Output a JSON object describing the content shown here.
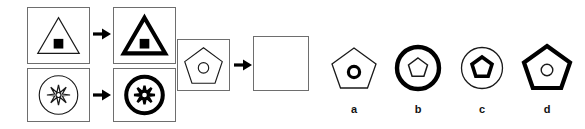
{
  "puzzle": {
    "kind": "visual-analogy-matrix",
    "rule_description": "outer shape outline becomes bold/thick; inner shape unchanged",
    "stroke_colors": {
      "thin": "#1a1a1a",
      "bold": "#000000",
      "panel_border": "#6e6e6e",
      "fill_black": "#000000",
      "background": "#ffffff"
    },
    "stroke_widths": {
      "thin": 1.2,
      "bold": 4.2,
      "inner_thin": 1.2,
      "inner_bold": 3.4
    }
  },
  "examples": [
    {
      "id": "example-row-1",
      "prompt": {
        "name": "triangle-with-square-thin",
        "outer_shape": "triangle",
        "outer_weight": "thin",
        "inner_shape": "square",
        "inner_weight": "filled"
      },
      "arrow": "arrow-right-icon",
      "result": {
        "name": "triangle-with-square-bold",
        "outer_shape": "triangle",
        "outer_weight": "bold",
        "inner_shape": "square",
        "inner_weight": "filled"
      }
    },
    {
      "id": "example-row-2",
      "prompt": {
        "name": "circle-with-starburst-thin",
        "outer_shape": "circle",
        "outer_weight": "thin",
        "inner_shape": "starburst",
        "inner_weight": "thin"
      },
      "arrow": "arrow-right-icon",
      "result": {
        "name": "circle-with-starburst-bold",
        "outer_shape": "circle",
        "outer_weight": "bold",
        "inner_shape": "starburst",
        "inner_weight": "bold"
      }
    }
  ],
  "question": {
    "id": "question-row",
    "prompt": {
      "name": "pentagon-with-circle-thin",
      "outer_shape": "pentagon",
      "outer_weight": "thin",
      "inner_shape": "circle",
      "inner_weight": "thin"
    },
    "arrow": "arrow-right-icon",
    "answer_box": {
      "name": "empty-answer-box",
      "content": ""
    }
  },
  "options": [
    {
      "label": "a",
      "name": "option-a",
      "outer_shape": "pentagon",
      "outer_weight": "thin",
      "inner_shape": "circle",
      "inner_weight": "bold"
    },
    {
      "label": "b",
      "name": "option-b",
      "outer_shape": "circle",
      "outer_weight": "bold",
      "inner_shape": "pentagon",
      "inner_weight": "thin"
    },
    {
      "label": "c",
      "name": "option-c",
      "outer_shape": "circle",
      "outer_weight": "thin",
      "inner_shape": "pentagon",
      "inner_weight": "bold"
    },
    {
      "label": "d",
      "name": "option-d",
      "outer_shape": "pentagon",
      "outer_weight": "bold",
      "inner_shape": "circle",
      "inner_weight": "thin"
    }
  ]
}
